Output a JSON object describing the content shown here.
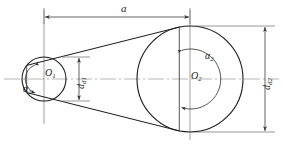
{
  "figure": {
    "type": "belt-drive-geometry"
  },
  "labels": {
    "center_distance": "a",
    "small_pulley_center": "O",
    "small_pulley_center_sub": "1",
    "large_pulley_center": "O",
    "large_pulley_center_sub": "2",
    "wrap_angle_small": "α",
    "wrap_angle_small_sub": "1",
    "wrap_angle_large": "α",
    "wrap_angle_large_sub": "2",
    "diameter_small": "d",
    "diameter_small_sub": "d1",
    "diameter_large": "d",
    "diameter_large_sub": "d2"
  },
  "geometry": {
    "small_pulley": {
      "cx": 44,
      "cy": 79,
      "r": 22
    },
    "large_pulley": {
      "cx": 190,
      "cy": 79,
      "r": 53
    },
    "center_distance_px": 146,
    "centerline_y": 79,
    "dim_a_y": 17,
    "dim_dd1_x": 79,
    "dim_dd2_x": 265,
    "arc_small_r": 15,
    "arc_large_r": 30
  },
  "colors": {
    "line": "#1a1a1a",
    "thin_line": "#555555",
    "centerline": "#8a8a8a",
    "dimension": "#4a4a4a",
    "background": "#ffffff"
  }
}
